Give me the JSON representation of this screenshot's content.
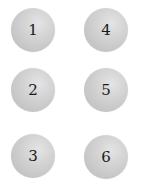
{
  "buttons": [
    {
      "label": "1",
      "x": 11,
      "y": 8
    },
    {
      "label": "2",
      "x": 11,
      "y": 68
    },
    {
      "label": "3",
      "x": 11,
      "y": 134
    },
    {
      "label": "4",
      "x": 84,
      "y": 8
    },
    {
      "label": "5",
      "x": 84,
      "y": 68
    },
    {
      "label": "6",
      "x": 84,
      "y": 135
    }
  ]
}
